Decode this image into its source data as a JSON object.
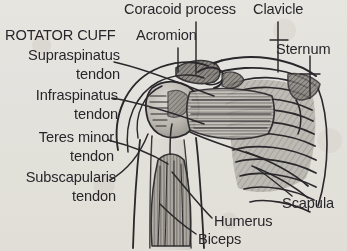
{
  "figure": {
    "kind": "anatomical-illustration",
    "style": "scanned grayscale line drawing with hatched shading",
    "background_color": "#f2f1ee",
    "ink_color": "#2c2a2e",
    "width": 347,
    "height": 251
  },
  "labels": {
    "rotator_cuff_heading": "ROTATOR CUFF",
    "supraspinatus_line1": "Supraspinatus",
    "supraspinatus_line2": "tendon",
    "infraspinatus_line1": "Infraspinatus",
    "infraspinatus_line2": "tendon",
    "teres_minor_line1": "Teres minor",
    "teres_minor_line2": "tendon",
    "subscapularis_line1": "Subscapularis",
    "subscapularis_line2": "tendon",
    "coracoid_process": "Coracoid process",
    "acromion": "Acromion",
    "clavicle": "Clavicle",
    "sternum": "Sternum",
    "scapula": "Scapula",
    "humerus": "Humerus",
    "biceps": "Biceps"
  },
  "structures": [
    {
      "name": "Coracoid process",
      "group": "bone"
    },
    {
      "name": "Clavicle",
      "group": "bone"
    },
    {
      "name": "Acromion",
      "group": "bone"
    },
    {
      "name": "Sternum",
      "group": "bone"
    },
    {
      "name": "Scapula",
      "group": "bone"
    },
    {
      "name": "Humerus",
      "group": "bone"
    },
    {
      "name": "Biceps",
      "group": "muscle"
    },
    {
      "name": "Supraspinatus tendon",
      "group": "rotator-cuff"
    },
    {
      "name": "Infraspinatus tendon",
      "group": "rotator-cuff"
    },
    {
      "name": "Teres minor tendon",
      "group": "rotator-cuff"
    },
    {
      "name": "Subscapularis tendon",
      "group": "rotator-cuff"
    }
  ]
}
